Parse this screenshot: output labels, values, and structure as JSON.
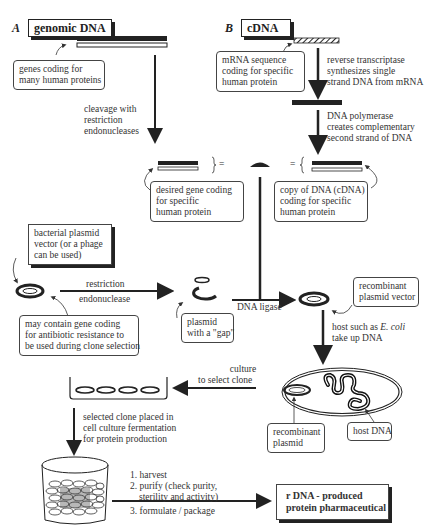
{
  "panel_a": {
    "letter": "A",
    "title": "genomic DNA",
    "genes_note": [
      "genes coding for",
      "many human proteins"
    ],
    "cleavage_note": [
      "cleavage with",
      "restriction",
      "endonucleases"
    ],
    "desired_gene_note": [
      "desired gene coding",
      "for specific",
      "human protein"
    ]
  },
  "panel_b": {
    "letter": "B",
    "title": "cDNA",
    "mrna_note": [
      "mRNA sequence",
      "coding for specific",
      "human protein"
    ],
    "rt_note": [
      "reverse transcriptase",
      "synthesizes single",
      "strand DNA from mRNA"
    ],
    "polymerase_note": [
      "DNA polymerase",
      "creates complementary",
      "second strand of DNA"
    ],
    "cdna_note": [
      "copy of DNA (cDNA)",
      "coding for specific",
      "human protein"
    ]
  },
  "equals_sign": "=",
  "plasmid": {
    "vector_note": [
      "bacterial plasmid",
      "vector (or a phage",
      "can be used)"
    ],
    "restriction_label": [
      "restriction",
      "endonuclease"
    ],
    "resistance_note": [
      "may contain gene coding",
      "for antibiotic resistance to",
      "be used during clone selection"
    ],
    "gap_note": [
      "plasmid",
      "with a \"gap\""
    ],
    "ligase_label": "DNA ligase",
    "recombinant_note": [
      "recombinant",
      "plasmid vector"
    ],
    "host_note": [
      "host such as ",
      "E. coli",
      "take up DNA"
    ]
  },
  "cell": {
    "recombinant_plasmid_note": [
      "recombinant",
      "plasmid"
    ],
    "host_dna_note": "host DNA",
    "culture_label": [
      "culture",
      "to select clone"
    ]
  },
  "production": {
    "clone_note": [
      "selected clone placed in",
      "cell culture fermentation",
      "for protein production"
    ],
    "steps": [
      "1. harvest",
      "2. purify (check purity,",
      "sterility and activity)",
      "3. formulate / package"
    ],
    "final_product": [
      "r DNA - produced",
      "protein pharmaceutical"
    ]
  }
}
